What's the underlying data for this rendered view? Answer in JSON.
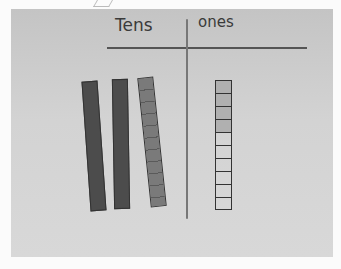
{
  "photo": {
    "subject": "place value mat",
    "headers": {
      "tens": "Tens",
      "ones": "ones"
    },
    "tens_rods": 3,
    "ones_column": {
      "cells": 10,
      "shaded": 4
    }
  }
}
